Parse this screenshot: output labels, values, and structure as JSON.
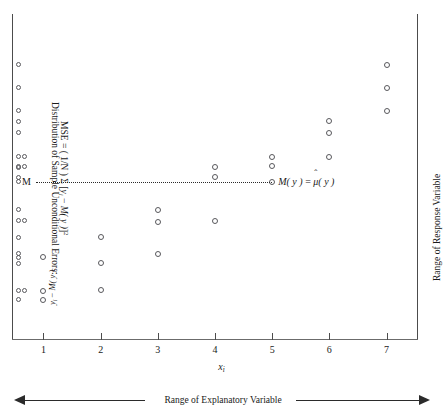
{
  "figure": {
    "x_axis_label": "x",
    "x_axis_label_sub": "i",
    "x_axis_range_caption": "Range of Explanatory Variable",
    "y_axis_range_caption": "Range of Response Variable",
    "mean_label_left": "M",
    "mean_label_right_prefix": "M",
    "mean_label_right_y1": "( y )",
    "mean_label_right_eq": "=",
    "mean_label_right_mu": "μ",
    "mean_label_right_hat": "ˆ",
    "mean_label_right_y2": "( y )",
    "annotation_title": "Distribution of Sample Unconditional Errors:",
    "mse_label": "MSE",
    "mse_equals": "=",
    "mse_factor": "( 1/N )",
    "mse_sigma": "Σ",
    "mse_bracket_open": "[",
    "mse_y": "y",
    "mse_y_sub": "i",
    "mse_minus": "−",
    "mse_my": "M( y )",
    "mse_bracket_close": "]",
    "mse_power": "2",
    "resid_num_y": "y",
    "resid_num_sub": "i",
    "resid_num_minus": "−",
    "resid_num_my": "M( y )",
    "marker_icon": "open-circle-marker",
    "arrow_left_icon": "arrow-left-icon",
    "arrow_right_icon": "arrow-right-icon",
    "colors": {
      "axis": "#4c4c4c",
      "marker_stroke": "#58585c",
      "mean_line": "#2b2b2b",
      "text": "#1a1a1a",
      "background": "#ffffff"
    }
  },
  "chart_data": {
    "type": "scatter",
    "title": "",
    "xlabel": "x_i",
    "ylabel": "Range of Response Variable",
    "xlim": [
      0.45,
      7.55
    ],
    "ylim": [
      0,
      100
    ],
    "grid": false,
    "legend": "none",
    "x_ticks": [
      1,
      2,
      3,
      4,
      5,
      6,
      7
    ],
    "x_tick_labels": [
      "1",
      "2",
      "3",
      "4",
      "5",
      "6",
      "7"
    ],
    "y_ticks": [],
    "y_tick_labels": [],
    "mean_line": {
      "label_left": "M",
      "label_right": "M(y) = μ̂(y)",
      "y_value": 50,
      "style": "dotted",
      "x_start": 1,
      "x_end": 5
    },
    "points": [
      {
        "x": 1,
        "y": 26.0
      },
      {
        "x": 1,
        "y": 15.3
      },
      {
        "x": 1,
        "y": 12.4
      },
      {
        "x": 2,
        "y": 32.3
      },
      {
        "x": 2,
        "y": 24.1
      },
      {
        "x": 2,
        "y": 15.5
      },
      {
        "x": 3,
        "y": 41.1
      },
      {
        "x": 3,
        "y": 37.1
      },
      {
        "x": 3,
        "y": 27.0
      },
      {
        "x": 4,
        "y": 54.5
      },
      {
        "x": 4,
        "y": 51.3
      },
      {
        "x": 4,
        "y": 37.6
      },
      {
        "x": 5,
        "y": 57.9
      },
      {
        "x": 5,
        "y": 54.8
      },
      {
        "x": 5,
        "y": 50.0
      },
      {
        "x": 6,
        "y": 69.2
      },
      {
        "x": 6,
        "y": 65.5
      },
      {
        "x": 6,
        "y": 57.9
      },
      {
        "x": 7,
        "y": 87.0
      },
      {
        "x": 7,
        "y": 79.7
      },
      {
        "x": 7,
        "y": 72.5
      }
    ],
    "marginal_strip": {
      "description": "Stacked open circles at left edge showing the unconditional distribution of y",
      "counts_by_level": [
        {
          "y": 87.0,
          "n": 1
        },
        {
          "y": 79.7,
          "n": 1
        },
        {
          "y": 72.5,
          "n": 1
        },
        {
          "y": 69.2,
          "n": 1
        },
        {
          "y": 65.5,
          "n": 1
        },
        {
          "y": 57.9,
          "n": 2
        },
        {
          "y": 54.8,
          "n": 2
        },
        {
          "y": 54.5,
          "n": 1
        },
        {
          "y": 51.3,
          "n": 1
        },
        {
          "y": 50.0,
          "n": 1
        },
        {
          "y": 41.1,
          "n": 1
        },
        {
          "y": 37.6,
          "n": 2
        },
        {
          "y": 32.3,
          "n": 1
        },
        {
          "y": 27.0,
          "n": 1
        },
        {
          "y": 26.0,
          "n": 1
        },
        {
          "y": 24.1,
          "n": 1
        },
        {
          "y": 15.5,
          "n": 2
        },
        {
          "y": 12.4,
          "n": 1
        }
      ]
    }
  }
}
